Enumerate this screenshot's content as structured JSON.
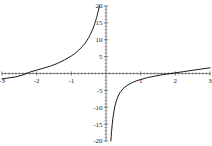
{
  "figure": {
    "title": "",
    "background_color": "#ffffff",
    "curve_color": "#000000",
    "axis_color": "#555555",
    "label_color": "#1a1a1a"
  },
  "chart_data": {
    "type": "line",
    "title": "",
    "xlabel": "",
    "ylabel": "",
    "xlim": [
      -3,
      3
    ],
    "ylim": [
      -20,
      20
    ],
    "grid": false,
    "legend": "none",
    "asymptotes": {
      "vertical": 0.1,
      "horizontal": 0
    },
    "x_ticks": [
      -3,
      -2,
      -1,
      1,
      2,
      3
    ],
    "x_tick_labels": [
      "-3",
      "-2",
      "-1",
      "1",
      "2",
      "3"
    ],
    "y_ticks": [
      -20,
      -15,
      -10,
      -5,
      5,
      10,
      15,
      20
    ],
    "y_tick_labels": [
      "-20",
      "-15",
      "-10",
      "-5",
      "5",
      "10",
      "15",
      "20"
    ],
    "x_minor_tick_step": 0.1,
    "y_minor_tick_step": 1,
    "series": [
      {
        "name": "left-branch",
        "x": [
          -3.0,
          -2.8,
          -2.6,
          -2.4,
          -2.3,
          -2.2,
          -2.0,
          -1.8,
          -1.6,
          -1.4,
          -1.2,
          -1.0,
          -0.9,
          -0.8,
          -0.7,
          -0.6,
          -0.5,
          -0.45,
          -0.4,
          -0.35,
          -0.3,
          -0.27,
          -0.25,
          -0.23,
          -0.21,
          -0.2,
          -0.19
        ],
        "y": [
          -1.6,
          -1.3,
          -1.0,
          -0.4,
          0.0,
          0.4,
          1.0,
          1.6,
          2.2,
          3.0,
          4.0,
          5.2,
          5.9,
          6.8,
          7.8,
          9.0,
          10.6,
          11.6,
          12.7,
          14.0,
          15.6,
          16.6,
          17.4,
          18.2,
          19.1,
          19.6,
          20.0
        ]
      },
      {
        "name": "right-branch",
        "x": [
          0.14,
          0.15,
          0.16,
          0.18,
          0.2,
          0.23,
          0.26,
          0.3,
          0.35,
          0.4,
          0.5,
          0.6,
          0.7,
          0.8,
          0.9,
          1.0,
          1.2,
          1.4,
          1.6,
          1.8,
          2.0,
          2.2,
          2.4,
          2.6,
          2.8,
          3.0
        ],
        "y": [
          -20.0,
          -18.6,
          -17.2,
          -15.0,
          -13.2,
          -11.2,
          -9.6,
          -8.1,
          -6.7,
          -5.7,
          -4.4,
          -3.6,
          -3.0,
          -2.5,
          -2.1,
          -1.8,
          -1.2,
          -0.8,
          -0.4,
          -0.1,
          0.2,
          0.5,
          0.8,
          1.1,
          1.4,
          1.7
        ]
      }
    ]
  },
  "axes": {
    "x_axis_name": "x-axis",
    "y_axis_name": "y-axis"
  }
}
